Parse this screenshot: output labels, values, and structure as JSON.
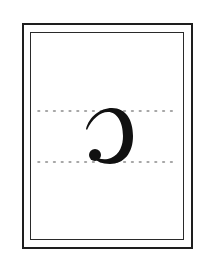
{
  "figure": {
    "glyph": {
      "name": "reversed-c",
      "char": "ɔ",
      "color": "#111111"
    },
    "guides": {
      "count": 2,
      "style": "dotted",
      "color": "#8a8a8a"
    },
    "frame": {
      "outer_color": "#1e1e1e",
      "inner_color": "#2a2a2a"
    }
  }
}
